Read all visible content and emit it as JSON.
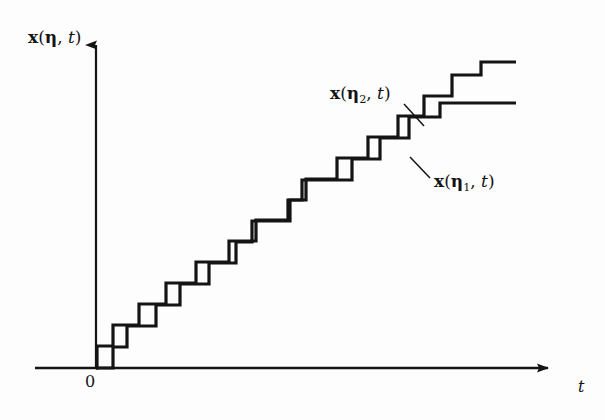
{
  "figure": {
    "name": "step-function-sample-paths",
    "background_color": "#fdfdfd",
    "line_color": "#141414",
    "axis_color": "#141414"
  },
  "axes": {
    "y_axis_label": "x(η, t)",
    "y_axis_label_parts": {
      "var": "x",
      "open": "(",
      "greek": "η",
      "comma": ", ",
      "t": "t",
      "close": ")"
    },
    "x_axis_label": "t",
    "origin_label": "0",
    "x_axis_y_px": 368,
    "y_axis_x_px": 96,
    "x_axis_start_px": 35,
    "x_axis_end_px": 560,
    "y_axis_top_px": 33,
    "arrowheads": [
      "y-axis-top",
      "x-axis-right"
    ]
  },
  "annotations": [
    {
      "name": "upper-curve-label",
      "text": "x(η₂, t)",
      "parts": {
        "var": "x",
        "open": "(",
        "greek": "η",
        "sub": "2",
        "comma": ", ",
        "t": "t",
        "close": ")"
      },
      "leader_from": [
        404,
        104
      ],
      "leader_to": [
        424,
        126
      ],
      "points_to": "upper-staircase"
    },
    {
      "name": "lower-curve-label",
      "text": "x(η₁, t)",
      "parts": {
        "var": "x",
        "open": "(",
        "greek": "η",
        "sub": "1",
        "comma": ", ",
        "t": "t",
        "close": ")"
      },
      "leader_from": [
        430,
        178
      ],
      "leader_to": [
        410,
        157
      ],
      "points_to": "lower-staircase"
    }
  ],
  "chart_data": {
    "type": "line",
    "title": "",
    "subtitle": "",
    "xlabel": "t",
    "ylabel": "x(η, t)",
    "grid": false,
    "legend": "inline-annotations",
    "xlim": [
      35,
      560
    ],
    "ylim": [
      368,
      33
    ],
    "note": "Two monotone right-continuous step functions (sample paths of a counting/jump process) drawn in screen pixel coordinates; y increases upward on screen as pixel value decreases.",
    "series": [
      {
        "name": "x(η₂, t)",
        "label": "upper-staircase",
        "style": "step-post",
        "stroke_width": 3.2,
        "points_px": [
          [
            96,
            368
          ],
          [
            97,
            368
          ],
          [
            97,
            346
          ],
          [
            113,
            346
          ],
          [
            113,
            325
          ],
          [
            139,
            325
          ],
          [
            139,
            304
          ],
          [
            166,
            304
          ],
          [
            166,
            283
          ],
          [
            196,
            283
          ],
          [
            196,
            262
          ],
          [
            229,
            262
          ],
          [
            229,
            241
          ],
          [
            256,
            241
          ],
          [
            256,
            220
          ],
          [
            288,
            220
          ],
          [
            288,
            200
          ],
          [
            306,
            200
          ],
          [
            306,
            179
          ],
          [
            337,
            179
          ],
          [
            337,
            158
          ],
          [
            368,
            158
          ],
          [
            368,
            137
          ],
          [
            398,
            137
          ],
          [
            398,
            116
          ],
          [
            424,
            116
          ],
          [
            424,
            96
          ],
          [
            452,
            96
          ],
          [
            452,
            75
          ],
          [
            481,
            75
          ],
          [
            481,
            62
          ],
          [
            516,
            62
          ]
        ]
      },
      {
        "name": "x(η₁, t)",
        "label": "lower-staircase",
        "style": "step-post",
        "stroke_width": 3.2,
        "points_px": [
          [
            96,
            368
          ],
          [
            113,
            368
          ],
          [
            113,
            347
          ],
          [
            127,
            347
          ],
          [
            127,
            326
          ],
          [
            156,
            326
          ],
          [
            156,
            305
          ],
          [
            180,
            305
          ],
          [
            180,
            284
          ],
          [
            209,
            284
          ],
          [
            209,
            263
          ],
          [
            236,
            263
          ],
          [
            236,
            242
          ],
          [
            252,
            242
          ],
          [
            252,
            221
          ],
          [
            290,
            221
          ],
          [
            290,
            200
          ],
          [
            302,
            200
          ],
          [
            302,
            180
          ],
          [
            352,
            180
          ],
          [
            352,
            159
          ],
          [
            380,
            159
          ],
          [
            380,
            138
          ],
          [
            409,
            138
          ],
          [
            409,
            117
          ],
          [
            440,
            117
          ],
          [
            440,
            103
          ],
          [
            516,
            103
          ]
        ]
      }
    ]
  }
}
